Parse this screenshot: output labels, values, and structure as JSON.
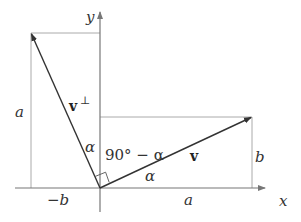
{
  "diagram": {
    "axes": {
      "x_label": "x",
      "y_label": "y"
    },
    "vectors": {
      "v": {
        "label": "v",
        "components": [
          "a",
          "b"
        ]
      },
      "v_perp": {
        "label": "v",
        "superscript": "⊥",
        "components": [
          "-b",
          "a"
        ]
      }
    },
    "labels": {
      "a_left": "a",
      "a_bottom": "a",
      "b_right": "b",
      "neg_b": "−b",
      "alpha_upper": "α",
      "alpha_lower": "α",
      "angle_complement": "90° − α"
    },
    "colors": {
      "vector": "#333333",
      "guide": "#999999",
      "axis": "#777777"
    }
  }
}
